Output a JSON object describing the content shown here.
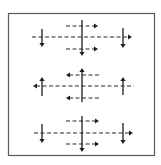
{
  "diagram": {
    "width": 161,
    "height": 165,
    "colors": {
      "background": "#ffffff",
      "frame": "#5a5a5a",
      "stroke": "#1e1e1e",
      "dashed": "#2a2a2a"
    },
    "frame": {
      "x": 8.5,
      "y": 13.5,
      "w": 146,
      "h": 142
    },
    "groups": [
      {
        "name": "top-group",
        "horizontal_direction": "right",
        "vertical_direction": "down",
        "dashed_arrows": [
          {
            "name": "upper-short-arrow",
            "x1": 66,
            "x2": 98,
            "y": 26,
            "dir": "right"
          },
          {
            "name": "main-arrow",
            "x1": 32,
            "x2": 132,
            "y": 37,
            "dir": "right"
          },
          {
            "name": "lower-short-arrow",
            "x1": 66,
            "x2": 98,
            "y": 49,
            "dir": "right"
          }
        ],
        "solid_arrows": [
          {
            "name": "center-vertical-arrow",
            "x": 82,
            "y1": 20,
            "y2": 56,
            "dir": "down"
          },
          {
            "name": "left-vertical-arrow",
            "x": 42,
            "y1": 29,
            "y2": 47,
            "dir": "down"
          },
          {
            "name": "right-vertical-arrow",
            "x": 123,
            "y1": 28,
            "y2": 48,
            "dir": "down"
          }
        ]
      },
      {
        "name": "middle-group",
        "horizontal_direction": "left",
        "vertical_direction": "up",
        "dashed_arrows": [
          {
            "name": "upper-short-arrow",
            "x1": 66,
            "x2": 99,
            "y": 75,
            "dir": "left"
          },
          {
            "name": "main-arrow",
            "x1": 33,
            "x2": 134,
            "y": 86,
            "dir": "left"
          },
          {
            "name": "lower-short-arrow",
            "x1": 66,
            "x2": 99,
            "y": 98,
            "dir": "left"
          }
        ],
        "solid_arrows": [
          {
            "name": "center-vertical-arrow",
            "x": 82,
            "y1": 68,
            "y2": 102,
            "dir": "up"
          },
          {
            "name": "left-vertical-arrow",
            "x": 42,
            "y1": 77,
            "y2": 96,
            "dir": "up"
          },
          {
            "name": "right-vertical-arrow",
            "x": 123,
            "y1": 77,
            "y2": 95,
            "dir": "up"
          }
        ]
      },
      {
        "name": "bottom-group",
        "horizontal_direction": "right",
        "vertical_direction": "down",
        "dashed_arrows": [
          {
            "name": "upper-short-arrow",
            "x1": 66,
            "x2": 99,
            "y": 121,
            "dir": "right"
          },
          {
            "name": "main-arrow",
            "x1": 34,
            "x2": 133,
            "y": 133,
            "dir": "right"
          },
          {
            "name": "lower-short-arrow",
            "x1": 66,
            "x2": 99,
            "y": 144,
            "dir": "right"
          }
        ],
        "solid_arrows": [
          {
            "name": "center-vertical-arrow",
            "x": 82,
            "y1": 116,
            "y2": 152,
            "dir": "down"
          },
          {
            "name": "left-vertical-arrow",
            "x": 42,
            "y1": 124,
            "y2": 143,
            "dir": "down"
          },
          {
            "name": "right-vertical-arrow",
            "x": 123,
            "y1": 123,
            "y2": 144,
            "dir": "down"
          }
        ]
      }
    ]
  }
}
